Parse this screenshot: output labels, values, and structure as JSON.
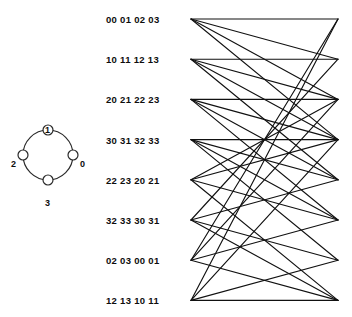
{
  "figure": {
    "width": 352,
    "height": 317,
    "background": "#ffffff",
    "line_color": "#111111"
  },
  "ring_diagram": {
    "name": "four-node-ring",
    "center_x": 48,
    "center_y": 155,
    "radius": 25,
    "node_radius": 5,
    "nodes": [
      {
        "id": "0",
        "label": "0",
        "angle_deg": 0,
        "label_x": 80,
        "label_y": 159
      },
      {
        "id": "1",
        "label": "1",
        "angle_deg": 270,
        "label_x": 45,
        "label_y": 125
      },
      {
        "id": "2",
        "label": "2",
        "angle_deg": 180,
        "label_x": 11,
        "label_y": 159
      },
      {
        "id": "3",
        "label": "3",
        "angle_deg": 90,
        "label_x": 45,
        "label_y": 198
      }
    ]
  },
  "network": {
    "left_x": 191,
    "right_x": 338,
    "top_y": 19,
    "row_spacing": 40.2,
    "row_count": 8,
    "degree": 4,
    "rows": [
      {
        "index": 0,
        "label": "00 01 02 03",
        "label_x": 106,
        "targets": [
          0,
          1,
          2,
          3
        ]
      },
      {
        "index": 1,
        "label": "10 11 12 13",
        "label_x": 106,
        "targets": [
          1,
          2,
          3,
          4
        ]
      },
      {
        "index": 2,
        "label": "20 21 22 23",
        "label_x": 106,
        "targets": [
          2,
          3,
          4,
          5
        ]
      },
      {
        "index": 3,
        "label": "30 31 32 33",
        "label_x": 106,
        "targets": [
          3,
          4,
          5,
          6
        ]
      },
      {
        "index": 4,
        "label": "22 23 20 21",
        "label_x": 106,
        "targets": [
          2,
          3,
          5,
          7
        ]
      },
      {
        "index": 5,
        "label": "32 33 30 31",
        "label_x": 106,
        "targets": [
          1,
          4,
          6,
          7
        ]
      },
      {
        "index": 6,
        "label": "02 03 00 01",
        "label_x": 106,
        "targets": [
          0,
          2,
          5,
          7
        ]
      },
      {
        "index": 7,
        "label": "12 13 10 11",
        "label_x": 106,
        "targets": [
          0,
          3,
          6,
          7
        ]
      }
    ]
  }
}
